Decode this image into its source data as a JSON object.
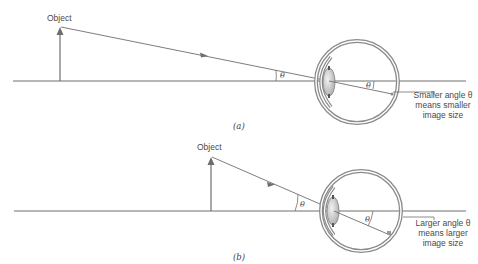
{
  "figure": {
    "panels": [
      {
        "id": "a",
        "caption": "(a)",
        "object_label": "Object",
        "theta_outside": "θ",
        "theta_inside": "θ",
        "note_lines": [
          "Smaller angle θ",
          "means smaller",
          "image size"
        ]
      },
      {
        "id": "b",
        "caption": "(b)",
        "object_label": "Object",
        "theta_outside": "θ",
        "theta_inside": "θ",
        "note_lines": [
          "Larger angle θ",
          "means larger",
          "image size"
        ]
      }
    ],
    "colors": {
      "line": "#6e6e6e",
      "eye_wall": "#8a8a8a",
      "eye_fill": "#e6e6e6",
      "lens_fill": "#cfcfcf",
      "text": "#4a4a4a"
    }
  }
}
